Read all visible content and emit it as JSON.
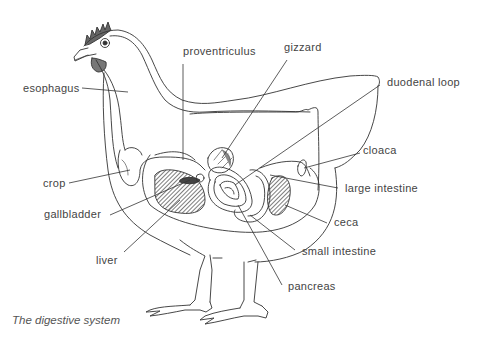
{
  "diagram": {
    "caption": "The digestive system",
    "labels": {
      "proventriculus": "proventriculus",
      "gizzard": "gizzard",
      "esophagus": "esophagus",
      "duodenal_loop": "duodenal loop",
      "cloaca": "cloaca",
      "crop": "crop",
      "large_intestine": "large intestine",
      "gallbladder": "gallbladder",
      "ceca": "ceca",
      "small_intestine": "small intestine",
      "liver": "liver",
      "pancreas": "pancreas"
    },
    "colors": {
      "line": "#333333",
      "text": "#444444",
      "shading": "#555555",
      "background": "#ffffff"
    }
  }
}
